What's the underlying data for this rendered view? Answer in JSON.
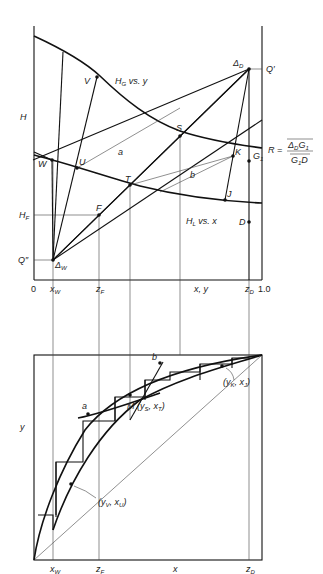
{
  "figure": {
    "top_diagram": {
      "type": "enthalpy-concentration (Ponchon-Savarit)",
      "y_axis_label": "H",
      "x_axis_label": "x, y",
      "x_ticks": [
        "0",
        "x_W",
        "z_F",
        "x, y",
        "z_D",
        "1.0"
      ],
      "curves": {
        "vapor": "H_G vs. y",
        "liquid": "H_L vs. x"
      },
      "points": {
        "delta_d": "Δ_D",
        "q_prime": "Q′",
        "delta_w": "Δ_W",
        "q_double_prime": "Q″",
        "feed": "F",
        "h_f": "H_F",
        "v": "V",
        "w": "W",
        "u": "U",
        "t": "T",
        "s": "S",
        "k": "K",
        "g1": "G₁",
        "j": "J",
        "d": "D"
      },
      "operating_lines": {
        "a": "a",
        "b": "b"
      },
      "reflux_formula": {
        "lhs": "R =",
        "numerator": "Δ_D G₁",
        "denominator": "G₁ D"
      }
    },
    "bottom_diagram": {
      "type": "x-y diagram (McCabe-Thiele style)",
      "y_axis_label": "y",
      "x_axis_label": "x",
      "x_ticks": [
        "x_W",
        "z_F",
        "x",
        "z_D"
      ],
      "points": {
        "a": "a",
        "b": "b",
        "m": "M (y_S, x_T)",
        "yk_xj": "(y_K, x_J)",
        "yv_xu": "(y_V, x_U)"
      }
    }
  },
  "labels": {
    "H": "H",
    "H_G": "H",
    "H_G_sub": "G",
    "vs_y": " vs. y",
    "H_L": "H",
    "H_L_sub": "L",
    "vs_x": " vs. x",
    "V": "V",
    "W": "W",
    "U": "U",
    "T": "T",
    "S": "S",
    "K": "K",
    "G1": "G",
    "G1_sub": "1",
    "J": "J",
    "D": "D",
    "F": "F",
    "HF": "H",
    "HF_sub": "F",
    "Qp": "Q′",
    "Qpp": "Q″",
    "DeltaD": "Δ",
    "DeltaD_sub": "D",
    "DeltaW": "Δ",
    "DeltaW_sub": "W",
    "a": "a",
    "b": "b",
    "R": "R =",
    "R_num": "Δ",
    "R_num_sub": "D",
    "R_num2": "G",
    "R_num2_sub": "1",
    "R_den": "G",
    "R_den_sub": "1",
    "R_den2": "D",
    "zero": "0",
    "one": "1.0",
    "xW": "x",
    "xW_sub": "W",
    "zF": "z",
    "zF_sub": "F",
    "xy": "x, y",
    "zD": "z",
    "zD_sub": "D",
    "y": "y",
    "x": "x",
    "a2": "a",
    "b2": "b",
    "M": "M (y",
    "M_sub1": "S",
    "M_mid": ", x",
    "M_sub2": "T",
    "M_end": ")",
    "YK": "(y",
    "YK_sub1": "K",
    "YK_mid": ", x",
    "YK_sub2": "J",
    "YK_end": ")",
    "YV": "(y",
    "YV_sub1": "V",
    "YV_mid": ", x",
    "YV_sub2": "U",
    "YV_end": ")",
    "xW2": "x",
    "xW2_sub": "W",
    "zF2": "z",
    "zF2_sub": "F",
    "x2": "x",
    "zD2": "z",
    "zD2_sub": "D"
  }
}
